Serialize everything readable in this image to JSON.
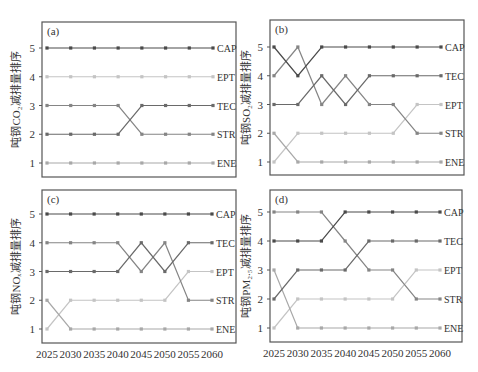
{
  "figure": {
    "x_ticks": [
      "2025",
      "2030",
      "2035",
      "2040",
      "2045",
      "2050",
      "2055",
      "2060"
    ],
    "y_ticks": [
      "1",
      "2",
      "3",
      "4",
      "5"
    ]
  },
  "colors": {
    "CAP": "#4a4a4a",
    "TEC": "#6a6a6a",
    "STR": "#858585",
    "EPT": "#c4c4c4",
    "ENE": "#a8a8a8",
    "frame": "#555555"
  },
  "chart_data": [
    {
      "type": "line",
      "panel": "(a)",
      "title": "(a)",
      "ylabel": "吨钢CO₂减排量排序",
      "xlabel": "",
      "x": [
        2025,
        2030,
        2035,
        2040,
        2045,
        2050,
        2055,
        2060
      ],
      "ylim": [
        1,
        5
      ],
      "grid": false,
      "legend_position": "right-end-labels",
      "series": [
        {
          "name": "CAP",
          "values": [
            5,
            5,
            5,
            5,
            5,
            5,
            5,
            5
          ]
        },
        {
          "name": "EPT",
          "values": [
            4,
            4,
            4,
            4,
            4,
            4,
            4,
            4
          ]
        },
        {
          "name": "TEC",
          "values": [
            2,
            2,
            2,
            2,
            3,
            3,
            3,
            3
          ]
        },
        {
          "name": "STR",
          "values": [
            3,
            3,
            3,
            3,
            2,
            2,
            2,
            2
          ]
        },
        {
          "name": "ENE",
          "values": [
            1,
            1,
            1,
            1,
            1,
            1,
            1,
            1
          ]
        }
      ]
    },
    {
      "type": "line",
      "panel": "(b)",
      "title": "(b)",
      "ylabel": "吨钢SO₂减排量排序",
      "xlabel": "",
      "x": [
        2025,
        2030,
        2035,
        2040,
        2045,
        2050,
        2055,
        2060
      ],
      "ylim": [
        1,
        5
      ],
      "grid": false,
      "legend_position": "right-end-labels",
      "series": [
        {
          "name": "CAP",
          "values": [
            5,
            4,
            5,
            5,
            5,
            5,
            5,
            5
          ]
        },
        {
          "name": "TEC",
          "values": [
            3,
            3,
            4,
            3,
            4,
            4,
            4,
            4
          ]
        },
        {
          "name": "EPT",
          "values": [
            1,
            2,
            2,
            2,
            2,
            2,
            3,
            3
          ]
        },
        {
          "name": "STR",
          "values": [
            4,
            5,
            3,
            4,
            3,
            3,
            2,
            2
          ]
        },
        {
          "name": "ENE",
          "values": [
            2,
            1,
            1,
            1,
            1,
            1,
            1,
            1
          ]
        }
      ]
    },
    {
      "type": "line",
      "panel": "(c)",
      "title": "(c)",
      "ylabel": "吨钢NOₓ减排量排序",
      "xlabel": "",
      "x": [
        2025,
        2030,
        2035,
        2040,
        2045,
        2050,
        2055,
        2060
      ],
      "ylim": [
        1,
        5
      ],
      "grid": false,
      "legend_position": "right-end-labels",
      "series": [
        {
          "name": "CAP",
          "values": [
            5,
            5,
            5,
            5,
            5,
            5,
            5,
            5
          ]
        },
        {
          "name": "TEC",
          "values": [
            3,
            3,
            3,
            3,
            4,
            3,
            4,
            4
          ]
        },
        {
          "name": "EPT",
          "values": [
            1,
            2,
            2,
            2,
            2,
            2,
            3,
            3
          ]
        },
        {
          "name": "STR",
          "values": [
            4,
            4,
            4,
            4,
            3,
            4,
            2,
            2
          ]
        },
        {
          "name": "ENE",
          "values": [
            2,
            1,
            1,
            1,
            1,
            1,
            1,
            1
          ]
        }
      ]
    },
    {
      "type": "line",
      "panel": "(d)",
      "title": "(d)",
      "ylabel": "吨钢PM₂.₅减排量排序",
      "xlabel": "",
      "x": [
        2025,
        2030,
        2035,
        2040,
        2045,
        2050,
        2055,
        2060
      ],
      "ylim": [
        1,
        5
      ],
      "grid": false,
      "legend_position": "right-end-labels",
      "series": [
        {
          "name": "CAP",
          "values": [
            4,
            4,
            4,
            5,
            5,
            5,
            5,
            5
          ]
        },
        {
          "name": "TEC",
          "values": [
            2,
            3,
            3,
            3,
            4,
            4,
            4,
            4
          ]
        },
        {
          "name": "EPT",
          "values": [
            1,
            2,
            2,
            2,
            2,
            2,
            3,
            3
          ]
        },
        {
          "name": "STR",
          "values": [
            5,
            5,
            5,
            4,
            3,
            3,
            2,
            2
          ]
        },
        {
          "name": "ENE",
          "values": [
            3,
            1,
            1,
            1,
            1,
            1,
            1,
            1
          ]
        }
      ]
    }
  ]
}
